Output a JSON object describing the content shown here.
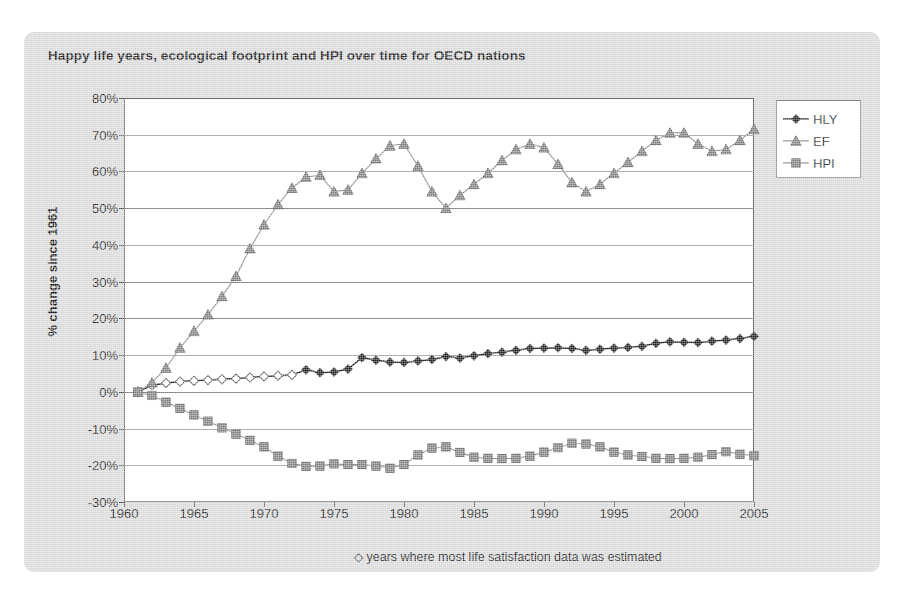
{
  "chart": {
    "title": "Happy life years, ecological footprint and HPI over time for OECD nations",
    "ylabel": "% change since 1961",
    "footnote_symbol": "◇",
    "footnote_text": "years where most life satisfaction data was estimated"
  },
  "legend": {
    "position": "top-right",
    "items": [
      {
        "label": "HLY",
        "marker": "diamond",
        "color": "#1c1c1c"
      },
      {
        "label": "EF",
        "marker": "triangle",
        "color": "#808080"
      },
      {
        "label": "HPI",
        "marker": "square",
        "color": "#808080"
      }
    ]
  },
  "axes": {
    "y_ticks": [
      "80%",
      "70%",
      "60%",
      "50%",
      "40%",
      "30%",
      "20%",
      "10%",
      "0%",
      "-10%",
      "-20%",
      "-30%"
    ],
    "y_values": [
      80,
      70,
      60,
      50,
      40,
      30,
      20,
      10,
      0,
      -10,
      -20,
      -30
    ],
    "x_ticks": [
      "1960",
      "1965",
      "1970",
      "1975",
      "1980",
      "1985",
      "1990",
      "1995",
      "2000",
      "2005"
    ],
    "x_values": [
      1960,
      1965,
      1970,
      1975,
      1980,
      1985,
      1990,
      1995,
      2000,
      2005
    ]
  },
  "chart_data": {
    "type": "line",
    "title": "Happy life years, ecological footprint and HPI over time for OECD nations",
    "xlabel": "",
    "ylabel": "% change since 1961",
    "xlim": [
      1960,
      2005
    ],
    "ylim": [
      -30,
      80
    ],
    "grid": true,
    "legend_position": "top-right",
    "annotation": "◇ years where most life satisfaction data was estimated",
    "x": [
      1961,
      1962,
      1963,
      1964,
      1965,
      1966,
      1967,
      1968,
      1969,
      1970,
      1971,
      1972,
      1973,
      1974,
      1975,
      1976,
      1977,
      1978,
      1979,
      1980,
      1981,
      1982,
      1983,
      1984,
      1985,
      1986,
      1987,
      1988,
      1989,
      1990,
      1991,
      1992,
      1993,
      1994,
      1995,
      1996,
      1997,
      1998,
      1999,
      2000,
      2001,
      2002,
      2003,
      2004,
      2005
    ],
    "series": [
      {
        "name": "HLY",
        "marker": "diamond",
        "color": "#1c1c1c",
        "estimated_through": 1972,
        "values": [
          0.0,
          1.8,
          2.4,
          2.8,
          3.0,
          3.2,
          3.4,
          3.6,
          3.9,
          4.2,
          4.4,
          4.6,
          6.0,
          5.2,
          5.4,
          6.2,
          9.3,
          8.6,
          8.1,
          8.0,
          8.4,
          8.8,
          9.6,
          9.2,
          9.8,
          10.4,
          10.8,
          11.3,
          11.8,
          11.9,
          12.0,
          11.8,
          11.3,
          11.6,
          11.9,
          12.1,
          12.4,
          13.2,
          13.6,
          13.5,
          13.4,
          13.8,
          14.1,
          14.5,
          15.1
        ]
      },
      {
        "name": "EF",
        "marker": "triangle",
        "color": "#808080",
        "values": [
          0.0,
          2.5,
          6.5,
          12.0,
          16.5,
          21.0,
          26.0,
          31.5,
          39.0,
          45.5,
          51.0,
          55.5,
          58.5,
          59.0,
          54.5,
          55.0,
          59.5,
          63.5,
          67.0,
          67.5,
          61.5,
          54.5,
          50.0,
          53.5,
          56.5,
          59.5,
          63.0,
          66.0,
          67.5,
          66.5,
          62.0,
          57.0,
          54.5,
          56.5,
          59.5,
          62.5,
          65.5,
          68.5,
          70.5,
          70.5,
          67.5,
          65.5,
          66.0,
          68.5,
          71.5
        ]
      },
      {
        "name": "HPI",
        "marker": "square",
        "color": "#808080",
        "values": [
          0.0,
          -1.0,
          -2.8,
          -4.5,
          -6.3,
          -8.0,
          -9.8,
          -11.5,
          -13.2,
          -15.0,
          -17.5,
          -19.5,
          -20.3,
          -20.2,
          -19.6,
          -19.8,
          -19.8,
          -20.2,
          -20.8,
          -19.8,
          -17.2,
          -15.3,
          -15.0,
          -16.5,
          -17.8,
          -18.1,
          -18.2,
          -18.1,
          -17.5,
          -16.4,
          -15.2,
          -14.0,
          -14.2,
          -15.0,
          -16.4,
          -17.2,
          -17.6,
          -18.1,
          -18.2,
          -18.1,
          -17.8,
          -17.1,
          -16.3,
          -17.0,
          -17.4
        ]
      }
    ]
  }
}
